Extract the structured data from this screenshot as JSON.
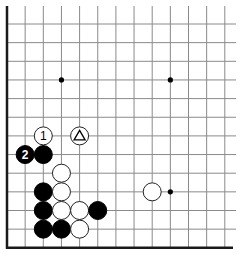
{
  "board": {
    "title": "Go board diagram (lower-left corner)",
    "columns": 13,
    "rows": 13,
    "origin_x": 7,
    "origin_y": 24,
    "spacing_x": 18.15,
    "spacing_y": 18.65,
    "grid_right_extent": 236,
    "grid_top_extent": 6,
    "edges": [
      "left",
      "bottom"
    ],
    "star_points": [
      {
        "col": 3,
        "row": 3
      },
      {
        "col": 9,
        "row": 3
      },
      {
        "col": 9,
        "row": 9
      }
    ],
    "stones": [
      {
        "color": "white",
        "col": 2,
        "row": 6,
        "label": "1"
      },
      {
        "color": "white",
        "col": 4,
        "row": 6,
        "label": "",
        "mark": "triangle"
      },
      {
        "color": "black",
        "col": 1,
        "row": 7,
        "label": "2"
      },
      {
        "color": "black",
        "col": 2,
        "row": 7,
        "label": ""
      },
      {
        "color": "white",
        "col": 3,
        "row": 8,
        "label": ""
      },
      {
        "color": "black",
        "col": 2,
        "row": 9,
        "label": ""
      },
      {
        "color": "white",
        "col": 3,
        "row": 9,
        "label": ""
      },
      {
        "color": "white",
        "col": 8,
        "row": 9,
        "label": ""
      },
      {
        "color": "black",
        "col": 2,
        "row": 10,
        "label": ""
      },
      {
        "color": "white",
        "col": 3,
        "row": 10,
        "label": ""
      },
      {
        "color": "white",
        "col": 4,
        "row": 10,
        "label": ""
      },
      {
        "color": "black",
        "col": 5,
        "row": 10,
        "label": ""
      },
      {
        "color": "black",
        "col": 2,
        "row": 11,
        "label": ""
      },
      {
        "color": "black",
        "col": 3,
        "row": 11,
        "label": ""
      },
      {
        "color": "white",
        "col": 4,
        "row": 11,
        "label": ""
      }
    ],
    "stone_radius": 9
  }
}
